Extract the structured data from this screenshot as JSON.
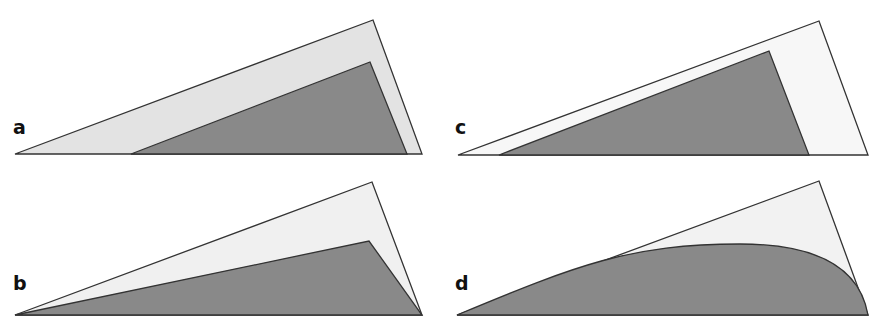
{
  "figure": {
    "colors": {
      "outer_fill_a": "#e3e3e3",
      "outer_fill_b": "#f0f0f0",
      "outer_fill_c": "#f7f7f7",
      "outer_fill_d": "#f2f2f2",
      "inner_fill": "#898989",
      "stroke": "#333333"
    },
    "panels": [
      {
        "label": "a",
        "outer_triangle": [
          [
            15,
            154
          ],
          [
            373,
            20
          ],
          [
            422,
            154
          ]
        ],
        "inner_shape": [
          [
            131,
            154
          ],
          [
            370,
            62
          ],
          [
            407,
            154
          ]
        ],
        "inner_type": "triangle"
      },
      {
        "label": "b",
        "outer_triangle": [
          [
            15,
            315
          ],
          [
            372,
            182
          ],
          [
            422,
            315
          ]
        ],
        "inner_shape": [
          [
            15,
            315
          ],
          [
            369,
            241
          ],
          [
            422,
            315
          ]
        ],
        "inner_type": "triangle"
      },
      {
        "label": "c",
        "outer_triangle": [
          [
            458,
            155
          ],
          [
            819,
            21
          ],
          [
            868,
            155
          ]
        ],
        "inner_shape": [
          [
            499,
            155
          ],
          [
            769,
            51
          ],
          [
            809,
            155
          ]
        ],
        "inner_type": "triangle"
      },
      {
        "label": "d",
        "outer_triangle": [
          [
            457,
            315
          ],
          [
            819,
            181
          ],
          [
            868,
            315
          ]
        ],
        "inner_type": "curve",
        "inner_shape": [
          [
            457,
            315
          ],
          [
            740,
            244
          ],
          [
            868,
            315
          ]
        ]
      }
    ]
  }
}
